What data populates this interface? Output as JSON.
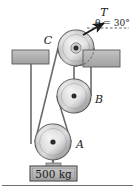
{
  "figure": {
    "labels": {
      "tension": "T",
      "angle": "θ = 30°",
      "pulley_c": "C",
      "pulley_b": "B",
      "pulley_a": "A",
      "mass": "500 kg"
    },
    "colors": {
      "pulley_fill": "#b9b9b9",
      "pulley_stroke": "#4a4a4a",
      "block_fill": "#b0b0b0",
      "block_stroke": "#4a4a4a",
      "rope": "#5a5a5a",
      "ink": "#1a1a1a",
      "background": "#ffffff",
      "rule": "#6e6e6e"
    },
    "geometry": {
      "pulley_c": {
        "cx": 76,
        "cy": 48,
        "r": 18
      },
      "pulley_b": {
        "cx": 74,
        "cy": 96,
        "r": 17
      },
      "pulley_a": {
        "cx": 53,
        "cy": 142,
        "r": 18
      },
      "left_block": {
        "x": 12,
        "y": 50,
        "w": 37,
        "h": 14
      },
      "right_block": {
        "x": 83,
        "y": 50,
        "w": 37,
        "h": 17
      },
      "mass_box": {
        "x": 30,
        "y": 166,
        "w": 47,
        "h": 15
      },
      "tension_angle_deg": 30
    }
  }
}
